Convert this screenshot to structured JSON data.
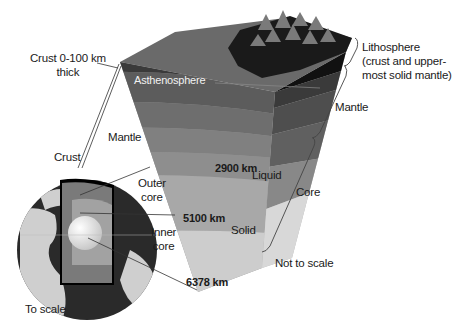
{
  "figure": {
    "colors": {
      "crust_dark": "#111111",
      "lithosphere": "#3a3a3a",
      "asthenosphere": "#5c5c5c",
      "mantle_upper": "#6e6e6e",
      "mantle_mid": "#808080",
      "mantle_lower": "#939393",
      "outer_core": "#a8a8a8",
      "inner_core": "#cfcfcf",
      "top_surface": "#6a6a6a",
      "globe_ocean": "#2a2a2a",
      "globe_land": "#cfcfcf"
    }
  },
  "wedge": {
    "labels": {
      "crust_thickness": "Crust 0-100 km",
      "crust_thickness_line2": "thick",
      "asthenosphere": "Asthenosphere",
      "mantle_left": "Mantle",
      "depth_core_boundary": "2900 km",
      "liquid": "Liquid",
      "depth_inner_core": "5100 km",
      "solid": "Solid",
      "depth_center": "6378 km",
      "not_to_scale": "Not to scale"
    }
  },
  "brackets": {
    "lithosphere": "Lithosphere",
    "lithosphere_desc_1": "(crust and upper-",
    "lithosphere_desc_2": "most solid mantle)",
    "mantle": "Mantle",
    "core": "Core"
  },
  "globe": {
    "labels": {
      "crust": "Crust",
      "outer_core": "Outer",
      "outer_core_2": "core",
      "inner_core": "Inner",
      "inner_core_2": "core",
      "to_scale": "To scale"
    }
  }
}
